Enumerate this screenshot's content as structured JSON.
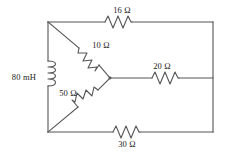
{
  "diagram": {
    "stroke_color": "#555555",
    "text_color": "#1a1a1a",
    "background": "#ffffff",
    "components": [
      {
        "id": "top-resistor",
        "icon": "resistor-icon",
        "label": "16 Ω",
        "value": 16,
        "unit": "Ω",
        "kind": "resistor",
        "orientation": "horizontal",
        "label_x": 122,
        "label_y": 10
      },
      {
        "id": "left-inductor",
        "icon": "inductor-icon",
        "label": "80 mH",
        "value": 80,
        "unit": "mH",
        "kind": "inductor",
        "orientation": "vertical",
        "label_x": 24,
        "label_y": 77
      },
      {
        "id": "upper-diagonal-resistor",
        "icon": "resistor-icon",
        "label": "10 Ω",
        "value": 10,
        "unit": "Ω",
        "kind": "resistor",
        "orientation": "diagonal",
        "label_x": 101,
        "label_y": 45
      },
      {
        "id": "lower-diagonal-resistor",
        "icon": "resistor-icon",
        "label": "50 Ω",
        "value": 50,
        "unit": "Ω",
        "kind": "resistor",
        "orientation": "diagonal",
        "label_x": 68,
        "label_y": 93
      },
      {
        "id": "middle-resistor",
        "icon": "resistor-icon",
        "label": "20 Ω",
        "value": 20,
        "unit": "Ω",
        "kind": "resistor",
        "orientation": "horizontal",
        "label_x": 162,
        "label_y": 66
      },
      {
        "id": "bottom-resistor",
        "icon": "resistor-icon",
        "label": "30 Ω",
        "value": 30,
        "unit": "Ω",
        "kind": "resistor",
        "orientation": "horizontal",
        "label_x": 127,
        "label_y": 144
      }
    ]
  }
}
